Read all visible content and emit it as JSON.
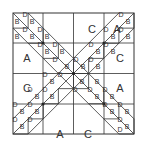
{
  "diagram": {
    "colors": {
      "line": "#333333",
      "background": "#ffffff",
      "text": "#333333"
    },
    "large_labels": [
      {
        "text": "C",
        "x": 92,
        "y": 33
      },
      {
        "text": "A",
        "x": 117,
        "y": 33
      },
      {
        "text": "A",
        "x": 27,
        "y": 62
      },
      {
        "text": "C",
        "x": 120,
        "y": 62
      },
      {
        "text": "C",
        "x": 27,
        "y": 92
      },
      {
        "text": "A",
        "x": 120,
        "y": 92
      },
      {
        "text": "A",
        "x": 60,
        "y": 138
      },
      {
        "text": "C",
        "x": 88,
        "y": 138
      }
    ],
    "small_labels": [
      {
        "text": "B",
        "x": 17,
        "y": 24
      },
      {
        "text": "D",
        "x": 25,
        "y": 17
      },
      {
        "text": "B",
        "x": 32,
        "y": 24
      },
      {
        "text": "B",
        "x": 17,
        "y": 39
      },
      {
        "text": "D",
        "x": 25,
        "y": 32
      },
      {
        "text": "B",
        "x": 32,
        "y": 39
      },
      {
        "text": "D",
        "x": 40,
        "y": 32
      },
      {
        "text": "B",
        "x": 47,
        "y": 39
      },
      {
        "text": "D",
        "x": 40,
        "y": 47
      },
      {
        "text": "B",
        "x": 47,
        "y": 54
      },
      {
        "text": "D",
        "x": 55,
        "y": 47
      },
      {
        "text": "B",
        "x": 62,
        "y": 54
      },
      {
        "text": "D",
        "x": 55,
        "y": 62
      },
      {
        "text": "D",
        "x": 121,
        "y": 17
      },
      {
        "text": "B",
        "x": 128,
        "y": 24
      },
      {
        "text": "D",
        "x": 106,
        "y": 32
      },
      {
        "text": "B",
        "x": 113,
        "y": 39
      },
      {
        "text": "D",
        "x": 121,
        "y": 32
      },
      {
        "text": "B",
        "x": 128,
        "y": 39
      },
      {
        "text": "D",
        "x": 91,
        "y": 47
      },
      {
        "text": "B",
        "x": 98,
        "y": 54
      },
      {
        "text": "D",
        "x": 106,
        "y": 47
      },
      {
        "text": "B",
        "x": 113,
        "y": 54
      },
      {
        "text": "D",
        "x": 76,
        "y": 62
      },
      {
        "text": "B",
        "x": 83,
        "y": 69
      },
      {
        "text": "D",
        "x": 91,
        "y": 62
      },
      {
        "text": "B",
        "x": 98,
        "y": 69
      },
      {
        "text": "B",
        "x": 67,
        "y": 69
      },
      {
        "text": "D",
        "x": 60,
        "y": 77
      },
      {
        "text": "B",
        "x": 82,
        "y": 84
      },
      {
        "text": "D",
        "x": 75,
        "y": 92
      },
      {
        "text": "B",
        "x": 52,
        "y": 84
      },
      {
        "text": "D",
        "x": 45,
        "y": 77
      },
      {
        "text": "B",
        "x": 52,
        "y": 99
      },
      {
        "text": "D",
        "x": 45,
        "y": 92
      },
      {
        "text": "B",
        "x": 37,
        "y": 99
      },
      {
        "text": "D",
        "x": 30,
        "y": 92
      },
      {
        "text": "B",
        "x": 37,
        "y": 114
      },
      {
        "text": "D",
        "x": 30,
        "y": 107
      },
      {
        "text": "B",
        "x": 22,
        "y": 114
      },
      {
        "text": "D",
        "x": 15,
        "y": 107
      },
      {
        "text": "B",
        "x": 22,
        "y": 129
      },
      {
        "text": "D",
        "x": 15,
        "y": 122
      },
      {
        "text": "D",
        "x": 30,
        "y": 122
      },
      {
        "text": "B",
        "x": 97,
        "y": 84
      },
      {
        "text": "D",
        "x": 90,
        "y": 92
      },
      {
        "text": "B",
        "x": 97,
        "y": 99
      },
      {
        "text": "D",
        "x": 105,
        "y": 92
      },
      {
        "text": "B",
        "x": 112,
        "y": 99
      },
      {
        "text": "D",
        "x": 105,
        "y": 107
      },
      {
        "text": "B",
        "x": 112,
        "y": 114
      },
      {
        "text": "D",
        "x": 120,
        "y": 107
      },
      {
        "text": "B",
        "x": 127,
        "y": 114
      },
      {
        "text": "D",
        "x": 120,
        "y": 122
      },
      {
        "text": "B",
        "x": 127,
        "y": 129
      },
      {
        "text": "D",
        "x": 120,
        "y": 132
      }
    ]
  }
}
